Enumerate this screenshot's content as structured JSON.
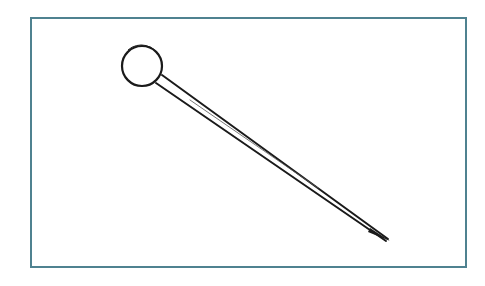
{
  "illustration": {
    "subject": "straight pin",
    "icon": "pin-icon",
    "caption": "Straight pin with round head",
    "colors": {
      "frame_border": "#4f8290",
      "stroke": "#1a1a1a",
      "background": "#ffffff"
    },
    "head": {
      "cx": 142,
      "cy": 66,
      "r": 20
    },
    "shaft": {
      "start": [
        158,
        79
      ],
      "tip": [
        389,
        240
      ]
    }
  }
}
